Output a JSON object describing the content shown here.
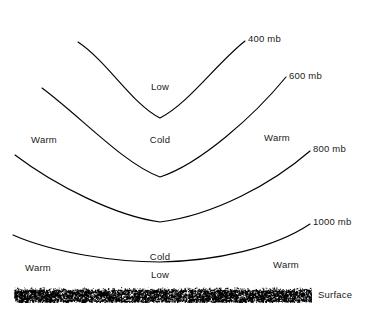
{
  "diagram": {
    "background_color": "#ffffff",
    "line_color": "#000000",
    "text_color": "#1a1a1a",
    "width": 372,
    "height": 314
  },
  "chart_data": {
    "type": "line",
    "title": "",
    "xlabel": "",
    "ylabel": "",
    "grid": false,
    "legend_position": "inline-right-end",
    "axis_ranges": {
      "x": [
        0,
        372
      ],
      "y": [
        0,
        314
      ]
    },
    "series": [
      {
        "name": "400 mb",
        "label": "400 mb",
        "path": "M 78 42 C 108 62, 132 104, 160 118 C 188 104, 216 64, 245 41",
        "label_x": 248,
        "label_y": 39,
        "trough_x": 160,
        "trough_y": 118,
        "left_end": [
          78,
          42
        ],
        "right_end": [
          245,
          41
        ]
      },
      {
        "name": "600 mb",
        "label": "600 mb",
        "path": "M 42 88 C 80 116, 124 164, 160 177 C 200 164, 254 116, 286 77",
        "label_x": 289,
        "label_y": 76,
        "trough_x": 160,
        "trough_y": 177,
        "left_end": [
          42,
          88
        ],
        "right_end": [
          286,
          77
        ]
      },
      {
        "name": "800 mb",
        "label": "800 mb",
        "path": "M 15 155 C 56 186, 116 216, 160 222 C 214 215, 272 184, 310 151",
        "label_x": 313,
        "label_y": 149,
        "trough_x": 160,
        "trough_y": 222,
        "left_end": [
          15,
          155
        ],
        "right_end": [
          310,
          151
        ]
      },
      {
        "name": "1000 mb",
        "label": "1000 mb",
        "path": "M 13 235 C 54 253, 116 262, 160 262 C 216 261, 274 248, 310 224",
        "label_x": 313,
        "label_y": 222,
        "trough_x": 160,
        "trough_y": 262,
        "left_end": [
          13,
          235
        ],
        "right_end": [
          310,
          224
        ]
      }
    ],
    "annotations": [
      {
        "text": "Low",
        "x": 160,
        "y": 87,
        "align": "center"
      },
      {
        "text": "Cold",
        "x": 160,
        "y": 140,
        "align": "center"
      },
      {
        "text": "Warm",
        "x": 44,
        "y": 140,
        "align": "center"
      },
      {
        "text": "Warm",
        "x": 277,
        "y": 138,
        "align": "center"
      },
      {
        "text": "Cold",
        "x": 160,
        "y": 257,
        "align": "center"
      },
      {
        "text": "Low",
        "x": 160,
        "y": 275,
        "align": "center"
      },
      {
        "text": "Warm",
        "x": 38,
        "y": 268,
        "align": "center"
      },
      {
        "text": "Warm",
        "x": 286,
        "y": 265,
        "align": "center"
      }
    ],
    "surface": {
      "label": "Surface",
      "label_x": 318,
      "label_y": 295,
      "band_x": 14,
      "band_y": 287,
      "band_width": 298,
      "band_height": 16,
      "texture": "stipple"
    }
  }
}
